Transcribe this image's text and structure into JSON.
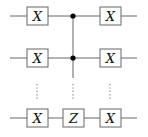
{
  "diagram": {
    "type": "quantum-circuit",
    "colors": {
      "wire": "#555555",
      "gate_border": "#555555",
      "control": "#000000"
    },
    "qubits": [
      {
        "row": 1,
        "gates": [
          "X",
          "control",
          "X"
        ]
      },
      {
        "row": 2,
        "gates": [
          "X",
          "control",
          "X"
        ]
      },
      {
        "row": "vdots",
        "gates": [
          "⋮",
          "⋮",
          "⋮"
        ]
      },
      {
        "row": "n",
        "gates": [
          "X",
          "Z",
          "X"
        ]
      }
    ],
    "labels": {
      "left_x_1": "X",
      "left_x_2": "X",
      "left_x_n": "X",
      "target_z": "Z",
      "right_x_1": "X",
      "right_x_2": "X",
      "right_x_n": "X"
    }
  }
}
